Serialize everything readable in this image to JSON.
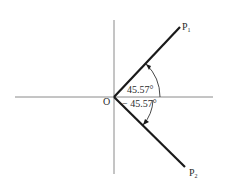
{
  "diagram": {
    "type": "angle-vector-diagram",
    "origin_label": "O",
    "axes": {
      "horizontal": {
        "x1": 15,
        "y": 97,
        "x2": 213
      },
      "vertical": {
        "x": 114,
        "y1": 20,
        "y2": 174
      }
    },
    "rays": [
      {
        "label_main": "P",
        "label_sub": "1",
        "angle_deg": 45.57,
        "end": [
          180,
          27
        ]
      },
      {
        "label_main": "P",
        "label_sub": "2",
        "angle_deg": -45.57,
        "end": [
          185,
          167
        ]
      }
    ],
    "angle_labels": {
      "upper": "45.57°",
      "lower": "− 45.57°"
    },
    "colors": {
      "axis": "#8a8a8a",
      "ray": "#1a1a1a",
      "arc": "#333333",
      "text": "#2a2a2a",
      "background": "#ffffff"
    }
  }
}
